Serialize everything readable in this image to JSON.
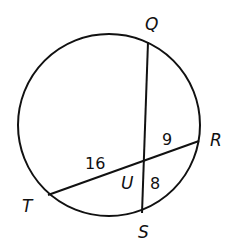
{
  "diagram": {
    "type": "circle-intersecting-chords",
    "circle": {
      "cx": 109,
      "cy": 125,
      "r": 91
    },
    "points": {
      "Q": {
        "label": "Q",
        "x": 148,
        "y": 42
      },
      "R": {
        "label": "R",
        "x": 199,
        "y": 141
      },
      "S": {
        "label": "S",
        "x": 142,
        "y": 213
      },
      "T": {
        "label": "T",
        "x": 48,
        "y": 195
      },
      "U": {
        "label": "U",
        "x": 144,
        "y": 161
      }
    },
    "chords": [
      {
        "from": "Q",
        "to": "S"
      },
      {
        "from": "T",
        "to": "R"
      }
    ],
    "segment_labels": {
      "TU": "16",
      "UR": "9",
      "US": "8"
    },
    "stroke_color": "#111111"
  }
}
